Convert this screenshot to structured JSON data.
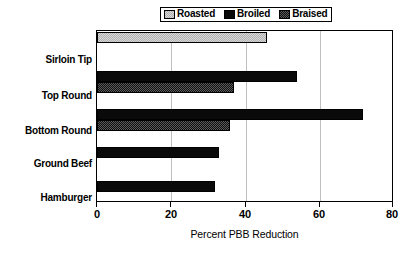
{
  "chart_data": {
    "type": "bar",
    "orientation": "horizontal",
    "title": "",
    "xlabel": "Percent PBB Reduction",
    "ylabel": "",
    "xlim": [
      0,
      80
    ],
    "xticks": [
      0,
      20,
      40,
      60,
      80
    ],
    "xtick_labels": [
      "0",
      "20",
      "40",
      "60",
      "80"
    ],
    "grid": true,
    "grid_axis": "x",
    "legend_position": "top",
    "categories": [
      "Sirloin Tip",
      "Top Round",
      "Bottom Round",
      "Ground Beef",
      "Hamburger"
    ],
    "series": [
      {
        "name": "Roasted",
        "swatch": "roasted",
        "color": "#b8b8b8",
        "values": [
          46,
          null,
          null,
          null,
          null
        ]
      },
      {
        "name": "Broiled",
        "swatch": "broiled",
        "color": "#0a0a0a",
        "values": [
          null,
          54,
          72,
          33,
          32
        ]
      },
      {
        "name": "Braised",
        "swatch": "braised",
        "color": "#141414",
        "values": [
          null,
          37,
          36,
          null,
          null
        ]
      }
    ]
  },
  "legend": {
    "entries": [
      {
        "label": "Roasted",
        "swatch": "roasted"
      },
      {
        "label": "Broiled",
        "swatch": "broiled"
      },
      {
        "label": "Braised",
        "swatch": "braised"
      }
    ]
  },
  "axis": {
    "x_title": "Percent PBB Reduction",
    "x_tick_labels": [
      "0",
      "20",
      "40",
      "60",
      "80"
    ]
  },
  "categories": [
    "Sirloin Tip",
    "Top Round",
    "Bottom Round",
    "Ground Beef",
    "Hamburger"
  ],
  "colors": {
    "roasted": "#b8b8b8",
    "broiled": "#0a0a0a",
    "braised": "#141414",
    "grid": "#bfbfbf",
    "axis": "#000000",
    "background": "#ffffff"
  }
}
